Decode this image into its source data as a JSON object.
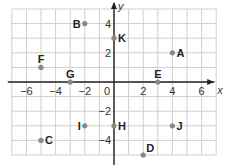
{
  "chart_data": {
    "type": "scatter",
    "title": "",
    "xlabel": "x",
    "ylabel": "y",
    "xlim": [
      -7,
      7
    ],
    "ylim": [
      -5,
      5
    ],
    "grid": true,
    "x_ticks": [
      -6,
      -4,
      -2,
      0,
      2,
      4,
      6
    ],
    "y_ticks": [
      4,
      2,
      -2,
      -4
    ],
    "points": [
      {
        "label": "A",
        "x": 4,
        "y": 2,
        "label_side": "right"
      },
      {
        "label": "B",
        "x": -2,
        "y": 4,
        "label_side": "left"
      },
      {
        "label": "C",
        "x": -5,
        "y": -4,
        "label_side": "right"
      },
      {
        "label": "D",
        "x": 2,
        "y": -5,
        "label_side": "above-right"
      },
      {
        "label": "E",
        "x": 3,
        "y": 0,
        "label_side": "above"
      },
      {
        "label": "F",
        "x": -5,
        "y": 1,
        "label_side": "above"
      },
      {
        "label": "G",
        "x": -3,
        "y": 0,
        "label_side": "above"
      },
      {
        "label": "H",
        "x": 0,
        "y": -3,
        "label_side": "right"
      },
      {
        "label": "I",
        "x": -2,
        "y": -3,
        "label_side": "left"
      },
      {
        "label": "J",
        "x": 4,
        "y": -3,
        "label_side": "right"
      },
      {
        "label": "K",
        "x": 0,
        "y": 3,
        "label_side": "right"
      }
    ]
  },
  "colors": {
    "grid": "#cfcfcf",
    "axis": "#222222",
    "point": "#888888",
    "label": "#222222"
  }
}
